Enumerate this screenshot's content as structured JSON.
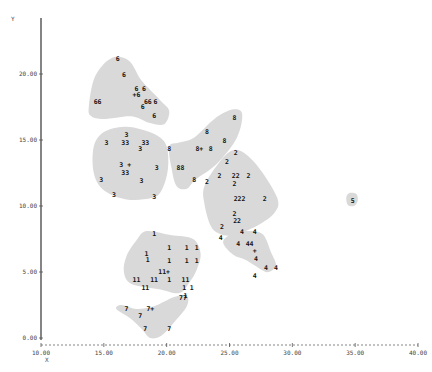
{
  "chart_data": {
    "type": "scatter",
    "title": "",
    "xlabel": "X",
    "ylabel": "Y",
    "xlim": [
      10,
      40
    ],
    "ylim": [
      0,
      24
    ],
    "x_ticks": [
      "10.00",
      "15.00",
      "20.00",
      "25.00",
      "30.00",
      "35.00",
      "40.00"
    ],
    "y_ticks": [
      "0.00",
      "5.00",
      "10.00",
      "15.00",
      "20.00"
    ],
    "grid": false,
    "legend": "none",
    "cluster_regions": [
      {
        "cluster": "6",
        "polygon": [
          [
            13.8,
            17.5
          ],
          [
            14.3,
            19.8
          ],
          [
            15.6,
            21.2
          ],
          [
            17.0,
            21.0
          ],
          [
            18.0,
            19.5
          ],
          [
            19.5,
            18.0
          ],
          [
            20.2,
            17.2
          ],
          [
            19.8,
            16.2
          ],
          [
            18.6,
            16.3
          ],
          [
            17.2,
            16.8
          ],
          [
            15.0,
            16.6
          ],
          [
            14.0,
            16.8
          ]
        ]
      },
      {
        "cluster": "3",
        "polygon": [
          [
            14.2,
            14.5
          ],
          [
            15.0,
            15.6
          ],
          [
            16.6,
            16.0
          ],
          [
            18.0,
            15.8
          ],
          [
            19.3,
            15.3
          ],
          [
            20.0,
            14.5
          ],
          [
            20.1,
            12.8
          ],
          [
            19.6,
            11.2
          ],
          [
            18.8,
            10.6
          ],
          [
            16.8,
            10.5
          ],
          [
            15.0,
            11.2
          ],
          [
            14.2,
            12.5
          ]
        ]
      },
      {
        "cluster": "8",
        "polygon": [
          [
            20.2,
            14.5
          ],
          [
            21.0,
            14.8
          ],
          [
            22.2,
            15.2
          ],
          [
            23.8,
            16.6
          ],
          [
            25.2,
            17.3
          ],
          [
            26.0,
            17.0
          ],
          [
            25.6,
            15.2
          ],
          [
            24.0,
            13.2
          ],
          [
            22.3,
            12.0
          ],
          [
            21.6,
            11.3
          ],
          [
            20.8,
            11.5
          ],
          [
            20.4,
            12.8
          ]
        ]
      },
      {
        "cluster": "2",
        "polygon": [
          [
            23.0,
            11.5
          ],
          [
            24.1,
            13.2
          ],
          [
            25.2,
            14.2
          ],
          [
            26.2,
            14.0
          ],
          [
            27.5,
            12.7
          ],
          [
            28.8,
            10.6
          ],
          [
            28.6,
            9.5
          ],
          [
            27.2,
            8.5
          ],
          [
            25.3,
            7.8
          ],
          [
            24.2,
            7.9
          ],
          [
            23.5,
            8.5
          ],
          [
            23.0,
            10.2
          ]
        ]
      },
      {
        "cluster": "1",
        "polygon": [
          [
            16.8,
            6.2
          ],
          [
            17.6,
            7.4
          ],
          [
            18.4,
            8.1
          ],
          [
            20.3,
            7.8
          ],
          [
            22.1,
            7.5
          ],
          [
            22.7,
            6.4
          ],
          [
            22.4,
            5.2
          ],
          [
            21.8,
            4.2
          ],
          [
            21.0,
            3.4
          ],
          [
            19.4,
            3.7
          ],
          [
            17.2,
            4.1
          ],
          [
            16.6,
            5.0
          ]
        ]
      },
      {
        "cluster": "4",
        "polygon": [
          [
            24.5,
            7.2
          ],
          [
            25.0,
            7.8
          ],
          [
            26.2,
            8.1
          ],
          [
            27.6,
            7.9
          ],
          [
            28.3,
            6.5
          ],
          [
            28.7,
            5.5
          ],
          [
            28.1,
            5.0
          ],
          [
            27.5,
            5.2
          ],
          [
            26.3,
            5.9
          ],
          [
            25.3,
            6.3
          ]
        ]
      },
      {
        "cluster": "7",
        "polygon": [
          [
            16.0,
            2.2
          ],
          [
            16.4,
            2.5
          ],
          [
            17.6,
            2.2
          ],
          [
            19.0,
            2.4
          ],
          [
            20.6,
            3.1
          ],
          [
            21.6,
            3.2
          ],
          [
            21.6,
            2.4
          ],
          [
            20.6,
            1.2
          ],
          [
            19.6,
            0.2
          ],
          [
            18.7,
            0.0
          ],
          [
            18.0,
            0.7
          ],
          [
            17.1,
            1.5
          ]
        ]
      },
      {
        "cluster": "5",
        "polygon": [
          [
            34.3,
            10.7
          ],
          [
            34.6,
            11.0
          ],
          [
            35.1,
            10.9
          ],
          [
            35.2,
            10.4
          ],
          [
            34.9,
            10.0
          ],
          [
            34.4,
            10.1
          ]
        ]
      }
    ],
    "points": [
      {
        "label": "6",
        "x": 16.1,
        "y": 21.1
      },
      {
        "label": "6",
        "x": 16.6,
        "y": 19.9
      },
      {
        "label": "6",
        "x": 17.6,
        "y": 18.9
      },
      {
        "label": "6",
        "x": 18.2,
        "y": 18.9
      },
      {
        "label": "+6",
        "x": 17.6,
        "y": 18.4
      },
      {
        "label": "66",
        "x": 18.5,
        "y": 17.9
      },
      {
        "label": "6",
        "x": 19.1,
        "y": 17.9
      },
      {
        "label": "6",
        "x": 18.1,
        "y": 17.5
      },
      {
        "label": "6",
        "x": 19.0,
        "y": 16.8
      },
      {
        "label": "66",
        "x": 14.5,
        "y": 17.9
      },
      {
        "label": "3",
        "x": 16.8,
        "y": 15.4
      },
      {
        "label": "3",
        "x": 15.2,
        "y": 14.8
      },
      {
        "label": "33",
        "x": 16.7,
        "y": 14.8
      },
      {
        "label": "33",
        "x": 18.3,
        "y": 14.8
      },
      {
        "label": "3",
        "x": 17.9,
        "y": 14.3
      },
      {
        "label": "3 +",
        "x": 16.7,
        "y": 13.1
      },
      {
        "label": "33",
        "x": 16.7,
        "y": 12.5
      },
      {
        "label": "3",
        "x": 19.2,
        "y": 12.9
      },
      {
        "label": "3",
        "x": 14.8,
        "y": 12.0
      },
      {
        "label": "3",
        "x": 18.0,
        "y": 11.9
      },
      {
        "label": "3",
        "x": 15.8,
        "y": 10.8
      },
      {
        "label": "3",
        "x": 19.0,
        "y": 10.7
      },
      {
        "label": "8",
        "x": 25.4,
        "y": 16.7
      },
      {
        "label": "8",
        "x": 23.2,
        "y": 15.6
      },
      {
        "label": "8",
        "x": 20.2,
        "y": 14.3
      },
      {
        "label": "8+",
        "x": 22.6,
        "y": 14.3
      },
      {
        "label": "8",
        "x": 23.5,
        "y": 14.3
      },
      {
        "label": "8",
        "x": 24.6,
        "y": 14.9
      },
      {
        "label": "88",
        "x": 21.1,
        "y": 12.9
      },
      {
        "label": "8",
        "x": 22.2,
        "y": 12.0
      },
      {
        "label": "2",
        "x": 25.5,
        "y": 14.0
      },
      {
        "label": "2",
        "x": 24.8,
        "y": 13.3
      },
      {
        "label": "2",
        "x": 24.2,
        "y": 12.3
      },
      {
        "label": "22",
        "x": 25.5,
        "y": 12.3
      },
      {
        "label": "2",
        "x": 26.5,
        "y": 12.3
      },
      {
        "label": "2",
        "x": 23.2,
        "y": 11.8
      },
      {
        "label": "2",
        "x": 25.4,
        "y": 11.7
      },
      {
        "label": "222",
        "x": 25.8,
        "y": 10.5
      },
      {
        "label": "2",
        "x": 27.8,
        "y": 10.5
      },
      {
        "label": "2",
        "x": 25.4,
        "y": 9.4
      },
      {
        "label": "22",
        "x": 25.6,
        "y": 8.9
      },
      {
        "label": "2",
        "x": 24.4,
        "y": 8.4
      },
      {
        "label": "1",
        "x": 19.0,
        "y": 7.9
      },
      {
        "label": "1",
        "x": 20.2,
        "y": 6.8
      },
      {
        "label": "1",
        "x": 21.6,
        "y": 6.8
      },
      {
        "label": "1",
        "x": 22.4,
        "y": 6.8
      },
      {
        "label": "1",
        "x": 18.4,
        "y": 6.4
      },
      {
        "label": "1",
        "x": 18.5,
        "y": 5.9
      },
      {
        "label": "1",
        "x": 20.2,
        "y": 5.8
      },
      {
        "label": "1",
        "x": 21.6,
        "y": 5.8
      },
      {
        "label": "1",
        "x": 22.4,
        "y": 5.8
      },
      {
        "label": "11+",
        "x": 19.8,
        "y": 5.0
      },
      {
        "label": "11",
        "x": 17.6,
        "y": 4.4
      },
      {
        "label": "11",
        "x": 19.0,
        "y": 4.4
      },
      {
        "label": "1",
        "x": 20.2,
        "y": 4.4
      },
      {
        "label": "11",
        "x": 21.5,
        "y": 4.4
      },
      {
        "label": "11",
        "x": 18.3,
        "y": 3.8
      },
      {
        "label": "1",
        "x": 21.4,
        "y": 3.8
      },
      {
        "label": "1",
        "x": 22.0,
        "y": 3.8
      },
      {
        "label": "1",
        "x": 21.5,
        "y": 3.2
      },
      {
        "label": "4",
        "x": 24.3,
        "y": 7.6
      },
      {
        "label": "4",
        "x": 26.0,
        "y": 8.0
      },
      {
        "label": "4",
        "x": 27.0,
        "y": 8.0
      },
      {
        "label": "4",
        "x": 25.7,
        "y": 7.1
      },
      {
        "label": "44",
        "x": 26.6,
        "y": 7.1
      },
      {
        "label": "+",
        "x": 27.0,
        "y": 6.6
      },
      {
        "label": "4",
        "x": 27.1,
        "y": 6.0
      },
      {
        "label": "4",
        "x": 27.9,
        "y": 5.3
      },
      {
        "label": "4",
        "x": 28.7,
        "y": 5.3
      },
      {
        "label": "4",
        "x": 27.0,
        "y": 4.7
      },
      {
        "label": "77",
        "x": 21.3,
        "y": 3.0
      },
      {
        "label": "7",
        "x": 16.8,
        "y": 2.2
      },
      {
        "label": "7+",
        "x": 18.7,
        "y": 2.2
      },
      {
        "label": "7",
        "x": 17.9,
        "y": 1.7
      },
      {
        "label": "7",
        "x": 18.3,
        "y": 0.7
      },
      {
        "label": "7",
        "x": 20.2,
        "y": 0.7
      },
      {
        "label": "5",
        "x": 34.8,
        "y": 10.4
      }
    ]
  }
}
